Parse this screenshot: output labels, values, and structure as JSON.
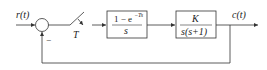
{
  "diagram": {
    "type": "closed-loop sampled-data control system block diagram",
    "input_label": "r(t)",
    "output_label": "c(t)",
    "summing_junction": {
      "feedback_sign": "−"
    },
    "sampler": {
      "label": "T"
    },
    "blocks": [
      {
        "name": "zero-order-hold",
        "numerator": "1 − e",
        "numerator_exp": "−Ts",
        "denominator": "s"
      },
      {
        "name": "plant",
        "numerator": "K",
        "denominator": "s(s+1)"
      }
    ],
    "colors": {
      "line": "#333333",
      "background": "#ffffff"
    }
  }
}
